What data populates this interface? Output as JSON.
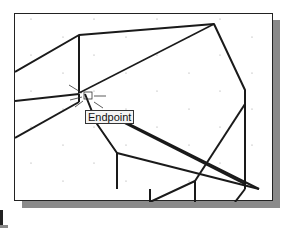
{
  "viewport": {
    "osnap_tooltip": "Endpoint",
    "colors": {
      "lines": "#1a1a1a",
      "shadow": "#8a8a8a",
      "grid": "#999999"
    }
  },
  "geometry": {
    "thick_lines": [
      [
        [
          14,
          71
        ],
        [
          78,
          34
        ]
      ],
      [
        [
          78,
          34
        ],
        [
          213,
          23
        ]
      ],
      [
        [
          213,
          23
        ],
        [
          244,
          89
        ]
      ],
      [
        [
          244,
          89
        ],
        [
          244,
          175
        ]
      ],
      [
        [
          78,
          34
        ],
        [
          78,
          91
        ]
      ],
      [
        [
          14,
          100
        ],
        [
          78,
          93
        ]
      ],
      [
        [
          78,
          91
        ],
        [
          213,
          23
        ]
      ],
      [
        [
          78,
          93
        ],
        [
          62,
          108
        ]
      ],
      [
        [
          116,
          165
        ],
        [
          116,
          200
        ]
      ],
      [
        [
          116,
          165
        ],
        [
          240,
          200
        ]
      ],
      [
        [
          14,
          147
        ],
        [
          40,
          140
        ]
      ],
      [
        [
          40,
          140
        ],
        [
          143,
          88
        ]
      ],
      [
        [
          14,
          178
        ],
        [
          47,
          170
        ]
      ],
      [
        [
          193,
          200
        ],
        [
          193,
          188
        ]
      ],
      [
        [
          193,
          188
        ],
        [
          237,
          175
        ]
      ],
      [
        [
          237,
          175
        ],
        [
          236,
          200
        ]
      ],
      [
        [
          82,
          108
        ],
        [
          128,
          135
        ]
      ]
    ]
  }
}
